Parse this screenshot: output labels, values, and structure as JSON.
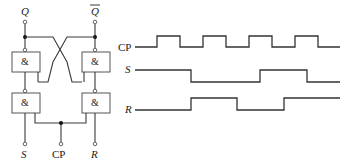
{
  "circuit": {
    "title": "Clocked RS flip-flop (NAND)",
    "outputs": {
      "q": "Q",
      "q_bar": "Q"
    },
    "inputs": {
      "s": "S",
      "cp": "CP",
      "r": "R"
    },
    "gates": [
      {
        "id": "g1",
        "symbol": "&",
        "position": "top-left"
      },
      {
        "id": "g2",
        "symbol": "&",
        "position": "top-right"
      },
      {
        "id": "g3",
        "symbol": "&",
        "position": "bottom-left"
      },
      {
        "id": "g4",
        "symbol": "&",
        "position": "bottom-right"
      }
    ]
  },
  "timing": {
    "signals": [
      {
        "name": "CP",
        "italic": false,
        "high_y": 36,
        "low_y": 47,
        "transitions_x": [
          135,
          157,
          180,
          203,
          226,
          249,
          272,
          295,
          318,
          340
        ],
        "start_level": "low"
      },
      {
        "name": "S",
        "italic": true,
        "high_y": 70,
        "low_y": 82,
        "transitions_x": [
          135,
          191,
          260,
          307,
          340
        ],
        "start_level": "high"
      },
      {
        "name": "R",
        "italic": true,
        "high_y": 98,
        "low_y": 110,
        "transitions_x": [
          135,
          191,
          237,
          284,
          340
        ],
        "start_level": "low"
      }
    ]
  },
  "colors": {
    "line": "#333333",
    "background": "#ffffff"
  }
}
